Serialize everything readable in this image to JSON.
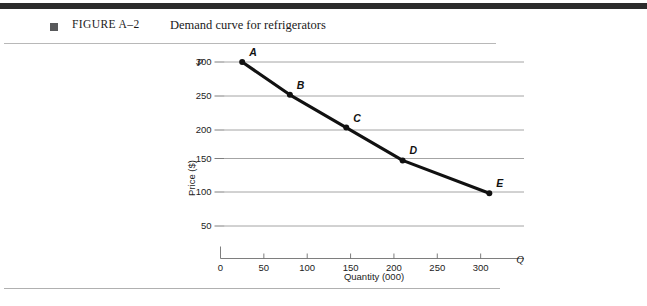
{
  "figure": {
    "bullet_icon": "square-bullet-icon",
    "number": "FIGURE A–2",
    "title": "Demand curve for refrigerators"
  },
  "chart_data": {
    "type": "line",
    "title": "Demand curve for refrigerators",
    "xlabel": "Quantity (000)",
    "ylabel": "Price ($)",
    "x_axis_symbol": "Q",
    "y_axis_symbol": "P",
    "xlim": [
      0,
      350
    ],
    "ylim": [
      0,
      325
    ],
    "xticks": [
      "0",
      "50",
      "100",
      "150",
      "200",
      "250",
      "300"
    ],
    "xtick_values": [
      0,
      50,
      100,
      150,
      200,
      250,
      300
    ],
    "yticks": [
      "50",
      "100",
      "150",
      "200",
      "250",
      "300"
    ],
    "ytick_values": [
      50,
      100,
      150,
      200,
      250,
      300
    ],
    "grid": "horizontal",
    "legend": "none",
    "series": [
      {
        "name": "Demand",
        "point_labels": [
          "A",
          "B",
          "C",
          "D",
          "E"
        ],
        "x": [
          25,
          80,
          145,
          210,
          310
        ],
        "y": [
          300,
          250,
          200,
          150,
          100
        ]
      }
    ],
    "colors": {
      "line": "#111111",
      "marker": "#111111",
      "grid": "#9a9a9a",
      "axis": "#6f6f6f",
      "rule": "#b8b8b8",
      "top_bar": "#2b2b2b",
      "bullet": "#58595b"
    }
  }
}
